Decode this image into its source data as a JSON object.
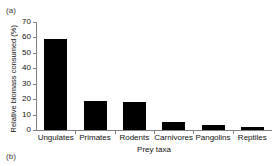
{
  "figure": {
    "panel_label_a": "(a)",
    "panel_label_b": "(b)"
  },
  "chart_data": {
    "type": "bar",
    "title": "",
    "xlabel": "Prey taxa",
    "ylabel": "Relative biomass consumed (%)",
    "categories": [
      "Ungulates",
      "Primates",
      "Rodents",
      "Carnivores",
      "Pangolins",
      "Reptiles"
    ],
    "values": [
      59,
      18.5,
      18,
      5.3,
      3,
      2
    ],
    "ylim": [
      0,
      70
    ],
    "yticks": [
      0,
      10,
      20,
      30,
      40,
      50,
      60,
      70
    ],
    "ytick_labels": [
      "0",
      "10",
      "20",
      "30",
      "40",
      "50",
      "60",
      "70"
    ],
    "grid": false,
    "legend": null,
    "bar_color": "#000000",
    "axis_color": "#808080"
  }
}
